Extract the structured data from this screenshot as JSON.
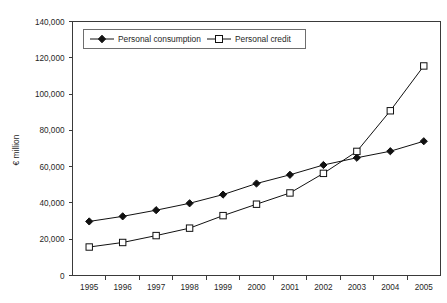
{
  "chart_data": {
    "type": "line",
    "title": "",
    "xlabel": "",
    "ylabel": "€ million",
    "categories": [
      "1995",
      "1996",
      "1997",
      "1998",
      "1999",
      "2000",
      "2001",
      "2002",
      "2003",
      "2004",
      "2005"
    ],
    "ylim": [
      0,
      140000
    ],
    "ytick_values": [
      0,
      20000,
      40000,
      60000,
      80000,
      100000,
      120000,
      140000
    ],
    "ytick_labels": [
      "0",
      "20,000",
      "40,000",
      "60,000",
      "80,000",
      "100,000",
      "120,000",
      "140,000"
    ],
    "grid": false,
    "legend_position": "top-left-inside",
    "series": [
      {
        "name": "Personal consumption",
        "marker": "filled-diamond",
        "color": "#111111",
        "values": [
          29800,
          32600,
          36000,
          39800,
          44600,
          50700,
          55500,
          60900,
          64900,
          68500,
          74000
        ]
      },
      {
        "name": "Personal credit",
        "marker": "open-square",
        "color": "#111111",
        "values": [
          15700,
          18200,
          22000,
          26100,
          33000,
          39300,
          45500,
          56300,
          68400,
          90800,
          115500
        ]
      }
    ]
  },
  "legend": {
    "entries": [
      {
        "label": "Personal consumption"
      },
      {
        "label": "Personal credit"
      }
    ]
  },
  "axes": {
    "y_axis_title": "€ million"
  }
}
